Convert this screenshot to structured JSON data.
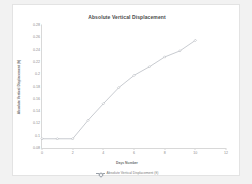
{
  "chart_data": {
    "type": "line",
    "title": "Absolute Vertical Displacement",
    "xlabel": "Days Number",
    "ylabel": "Absolute Vertical Displacement (ft)",
    "x": [
      0,
      1,
      2,
      3,
      4,
      5,
      6,
      7,
      8,
      9,
      10
    ],
    "values": [
      0.095,
      0.095,
      0.095,
      0.125,
      0.152,
      0.178,
      0.198,
      0.212,
      0.228,
      0.238,
      0.255
    ],
    "series": [
      {
        "name": "Absolute Vertical Displacement (ft)",
        "values": [
          0.095,
          0.095,
          0.095,
          0.125,
          0.152,
          0.178,
          0.198,
          0.212,
          0.228,
          0.238,
          0.255
        ]
      }
    ],
    "xticks": [
      "0",
      "2",
      "4",
      "6",
      "8",
      "10",
      "12"
    ],
    "xtick_values": [
      0,
      2,
      4,
      6,
      8,
      10,
      12
    ],
    "yticks": [
      "0.08",
      "0.1",
      "0.12",
      "0.14",
      "0.16",
      "0.18",
      "0.2",
      "0.22",
      "0.24",
      "0.26",
      "0.28"
    ],
    "ytick_values": [
      0.08,
      0.1,
      0.12,
      0.14,
      0.16,
      0.18,
      0.2,
      0.22,
      0.24,
      0.26,
      0.28
    ],
    "xlim": [
      0,
      12
    ],
    "ylim": [
      0.08,
      0.28
    ],
    "grid": false,
    "legend_position": "bottom",
    "legend": [
      "Absolute Vertical Displacement (ft)"
    ],
    "marker": "diamond",
    "line_color": "#9aa0a8",
    "background_color": "#ffffff",
    "page_background": "#f2f2f2"
  }
}
